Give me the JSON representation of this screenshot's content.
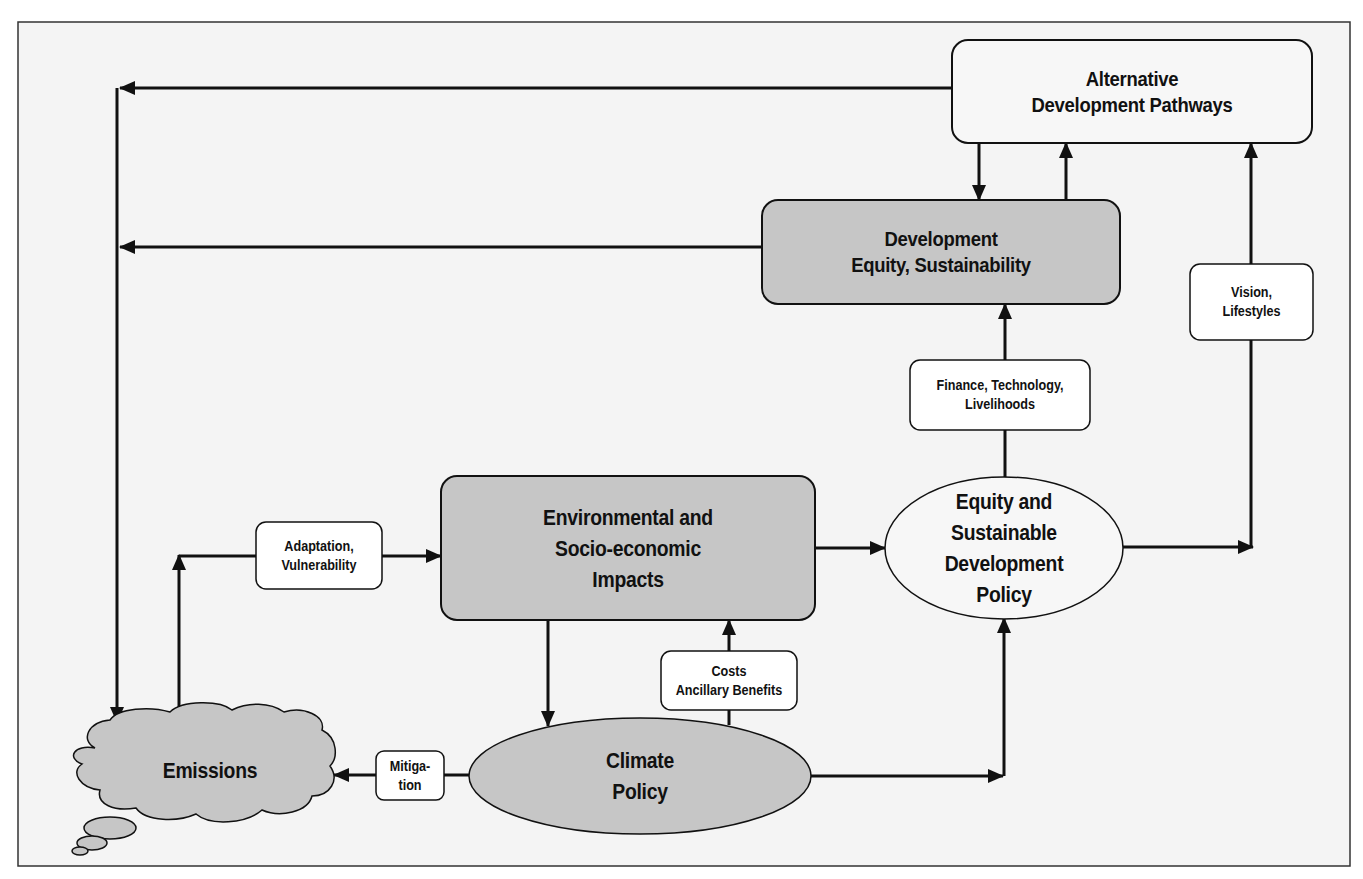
{
  "diagram": {
    "colors": {
      "background": "#f4f4f4",
      "frame_border": "#333333",
      "shaded_fill": "#c8c8c8",
      "light_fill": "#f7f7f7",
      "line": "#111111"
    },
    "nodes": {
      "alternative_pathways": {
        "lines": [
          "Alternative",
          "Development Pathways"
        ],
        "shape": "rounded-rect",
        "fill": "light"
      },
      "development": {
        "lines": [
          "Development",
          "Equity, Sustainability"
        ],
        "shape": "rounded-rect",
        "fill": "shaded"
      },
      "impacts": {
        "lines": [
          "Environmental and",
          "Socio-economic",
          "Impacts"
        ],
        "shape": "rounded-rect",
        "fill": "shaded"
      },
      "equity_policy": {
        "lines": [
          "Equity and",
          "Sustainable",
          "Development",
          "Policy"
        ],
        "shape": "ellipse",
        "fill": "light"
      },
      "climate_policy": {
        "lines": [
          "Climate",
          "Policy"
        ],
        "shape": "ellipse",
        "fill": "shaded"
      },
      "emissions": {
        "lines": [
          "Emissions"
        ],
        "shape": "cloud",
        "fill": "shaded"
      }
    },
    "edge_labels": {
      "vision": [
        "Vision,",
        "Lifestyles"
      ],
      "finance": [
        "Finance, Technology,",
        "Livelihoods"
      ],
      "adaptation": [
        "Adaptation,",
        "Vulnerability"
      ],
      "costs": [
        "Costs",
        "Ancillary Benefits"
      ],
      "mitigation": [
        "Mitiga-",
        "tion"
      ]
    },
    "edges": [
      {
        "from": "alternative_pathways",
        "to": "emissions",
        "label": null
      },
      {
        "from": "development",
        "to": "emissions",
        "label": null
      },
      {
        "from": "alternative_pathways",
        "to": "development",
        "label": null
      },
      {
        "from": "development",
        "to": "alternative_pathways",
        "label": null
      },
      {
        "from": "equity_policy",
        "to": "development",
        "label": "finance"
      },
      {
        "from": "equity_policy",
        "to": "alternative_pathways",
        "label": "vision"
      },
      {
        "from": "emissions",
        "to": "impacts",
        "label": "adaptation"
      },
      {
        "from": "impacts",
        "to": "equity_policy",
        "label": null
      },
      {
        "from": "impacts",
        "to": "climate_policy",
        "label": null
      },
      {
        "from": "climate_policy",
        "to": "impacts",
        "label": "costs"
      },
      {
        "from": "climate_policy",
        "to": "emissions",
        "label": "mitigation"
      },
      {
        "from": "climate_policy",
        "to": "equity_policy",
        "label": null
      }
    ]
  }
}
